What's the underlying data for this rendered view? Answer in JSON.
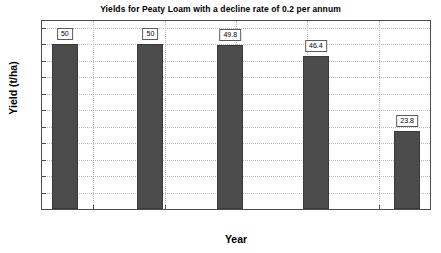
{
  "chart_data": {
    "type": "bar",
    "title": "Yields for Peaty Loam with a decline rate of 0.2 per annum",
    "xlabel": "Year",
    "ylabel": "Yield (t/ha)",
    "x": [
      2003,
      2009,
      2014.6,
      2020.6,
      2027
    ],
    "values": [
      50,
      50,
      49.8,
      46.4,
      23.8
    ],
    "data_labels": [
      "50",
      "50",
      "49.8",
      "46.4",
      "23.8"
    ],
    "xlim": [
      2001.4,
      2028.6
    ],
    "ylim": [
      0,
      57
    ],
    "xticks": [
      2005,
      2010,
      2015,
      2020,
      2025
    ],
    "xtick_labels": [
      "2005",
      "2010",
      "2015",
      "2020",
      "2025"
    ],
    "yticks": [
      0,
      5,
      10,
      15,
      20,
      25,
      30,
      35,
      40,
      45,
      50,
      55
    ],
    "ytick_labels": [
      "0",
      "5",
      "10",
      "15",
      "20",
      "25",
      "30",
      "35",
      "40",
      "45",
      "50",
      "55"
    ],
    "grid": true,
    "legend": null,
    "bar_color": "#4c4c4c",
    "grid_color": "#b9b9b9",
    "axis_color": "#4d4d4d",
    "background": "#ffffff"
  }
}
